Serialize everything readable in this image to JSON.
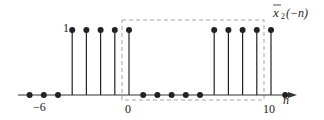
{
  "chart_data": {
    "type": "stem",
    "xlabel": "n",
    "ylabel": "",
    "x_tick_labels": [
      "−6",
      "0",
      "10"
    ],
    "y_tick_labels": [
      "1"
    ],
    "x": [
      -7,
      -6,
      -5,
      -4,
      -3,
      -2,
      -1,
      0,
      1,
      2,
      3,
      4,
      5,
      6,
      7,
      8,
      9,
      10,
      11
    ],
    "values": [
      0,
      0,
      0,
      1,
      1,
      1,
      1,
      1,
      0,
      0,
      0,
      0,
      0,
      1,
      1,
      1,
      1,
      1,
      0
    ],
    "annotations": [
      "dashed box marks one period from n=0 to n=10"
    ]
  },
  "labels": {
    "title_main": "x",
    "title_sub": "2",
    "title_arg": "(−n)",
    "xlabel": "n",
    "tick_neg6": "−6",
    "tick_0": "0",
    "tick_10": "10",
    "tick_1": "1"
  },
  "colors": {
    "stem": "#222222",
    "dashed": "#999999",
    "axis": "#333333"
  }
}
